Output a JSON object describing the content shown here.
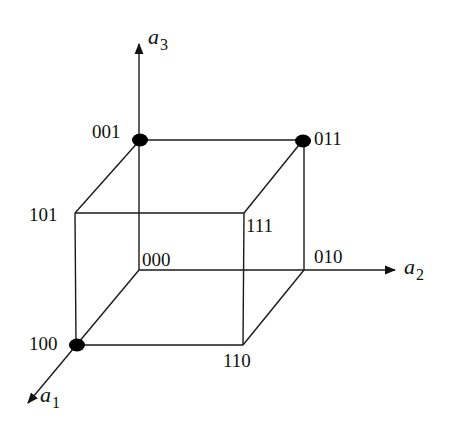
{
  "diagram": {
    "type": "boolean-cube",
    "axes": [
      {
        "id": "a1",
        "base": "a",
        "sub": "1",
        "from": [
          76,
          345
        ],
        "to": [
          27,
          404
        ]
      },
      {
        "id": "a2",
        "base": "a",
        "sub": "2",
        "from": [
          139,
          270
        ],
        "to": [
          397,
          270
        ]
      },
      {
        "id": "a3",
        "base": "a",
        "sub": "3",
        "from": [
          139,
          270
        ],
        "to": [
          139,
          42
        ]
      }
    ],
    "vertices": [
      {
        "code": "000",
        "x": 139,
        "y": 270,
        "marked": false
      },
      {
        "code": "001",
        "x": 140,
        "y": 140,
        "marked": true
      },
      {
        "code": "010",
        "x": 304,
        "y": 270,
        "marked": false
      },
      {
        "code": "011",
        "x": 303,
        "y": 140,
        "marked": true
      },
      {
        "code": "100",
        "x": 76,
        "y": 345,
        "marked": true
      },
      {
        "code": "101",
        "x": 75,
        "y": 213,
        "marked": false
      },
      {
        "code": "110",
        "x": 243,
        "y": 345,
        "marked": false
      },
      {
        "code": "111",
        "x": 244,
        "y": 213,
        "marked": false
      }
    ],
    "edges": [
      [
        "001",
        "011"
      ],
      [
        "001",
        "101"
      ],
      [
        "011",
        "111"
      ],
      [
        "101",
        "111"
      ],
      [
        "101",
        "100"
      ],
      [
        "111",
        "110"
      ],
      [
        "100",
        "110"
      ],
      [
        "000",
        "100"
      ],
      [
        "010",
        "110"
      ],
      [
        "011",
        "010"
      ]
    ],
    "labels": {
      "v000": "000",
      "v001": "001",
      "v010": "010",
      "v011": "011",
      "v100": "100",
      "v101": "101",
      "v110": "110",
      "v111": "111",
      "a1_base": "a",
      "a1_sub": "1",
      "a2_base": "a",
      "a2_sub": "2",
      "a3_base": "a",
      "a3_sub": "3"
    },
    "colors": {
      "line": "#1a1a1a",
      "dot": "#000000",
      "background": "#ffffff"
    }
  }
}
